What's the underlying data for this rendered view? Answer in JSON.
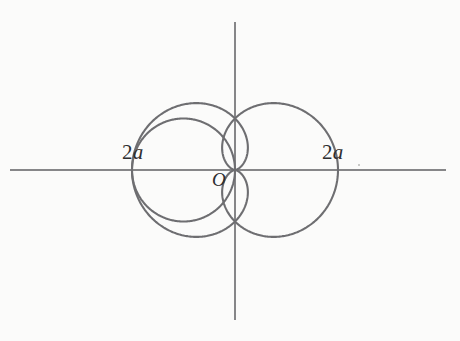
{
  "figure": {
    "background_color": "#fbfbfa",
    "stroke_color": "#6e6e71",
    "axis_color": "#5f5f62",
    "text_color": "#2e2e30",
    "labels": {
      "left_extent": {
        "number": "2",
        "symbol": "a",
        "full": "2a"
      },
      "right_extent": {
        "number": "2",
        "symbol": "a",
        "full": "2a"
      },
      "origin": "O"
    }
  },
  "chart_data": {
    "type": "line",
    "title": "",
    "subtitle": "",
    "xlabel": "",
    "ylabel": "",
    "grid": false,
    "legend": "none",
    "coordinate_system": "polar",
    "axes": {
      "x_axis": {
        "visible": true,
        "from_px": 10,
        "to_px": 446,
        "y_px": 170
      },
      "y_axis": {
        "visible": true,
        "from_px": 22,
        "to_px": 320,
        "x_px": 235
      },
      "origin_px": {
        "x": 235,
        "y": 170
      },
      "scale_px_per_a": 51.5
    },
    "annotations": [
      {
        "text": "2a",
        "x_px": 122,
        "y_px": 142,
        "meaning": "horizontal extent of left curve from origin"
      },
      {
        "text": "2a",
        "x_px": 322,
        "y_px": 142,
        "meaning": "horizontal extent of right curve from origin"
      },
      {
        "text": "O",
        "x_px": 212,
        "y_px": 170,
        "meaning": "origin / pole"
      }
    ],
    "series": [
      {
        "name": "cardioid-right",
        "equation": "r = a(1 + cos(theta))",
        "r_max": 2,
        "cusp": "origin",
        "opens": "right",
        "color": "#6e6e71"
      },
      {
        "name": "cardioid-left",
        "equation": "r = a(1 - cos(theta))",
        "r_max": 2,
        "cusp": "origin",
        "opens": "left",
        "color": "#6e6e71"
      },
      {
        "name": "circle-left",
        "equation": "r = -2a cos(theta)",
        "diameter": 2,
        "passes_through": "origin",
        "center_offset_a": -1,
        "color": "#6e6e71"
      }
    ],
    "x": [
      0,
      30,
      60,
      90,
      120,
      150,
      180,
      210,
      240,
      270,
      300,
      330,
      360
    ],
    "theta_unit": "degrees",
    "r_values": {
      "cardioid-right": [
        2.0,
        1.87,
        1.5,
        1.0,
        0.5,
        0.13,
        0.0,
        0.13,
        0.5,
        1.0,
        1.5,
        1.87,
        2.0
      ],
      "cardioid-left": [
        0.0,
        0.13,
        0.5,
        1.0,
        1.5,
        1.87,
        2.0,
        1.87,
        1.5,
        1.0,
        0.5,
        0.13,
        0.0
      ],
      "circle-left": [
        0.0,
        0.0,
        0.0,
        0.0,
        1.0,
        1.73,
        2.0,
        1.73,
        1.0,
        0.0,
        0.0,
        0.0,
        0.0
      ]
    },
    "xlim": [
      -2.1,
      2.1
    ],
    "ylim": [
      -1.5,
      1.5
    ]
  }
}
